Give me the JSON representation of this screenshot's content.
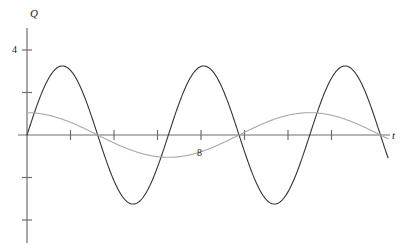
{
  "chart_data": {
    "type": "line",
    "title": "",
    "xlabel": "t",
    "ylabel": "Q",
    "xlim": [
      -0.2,
      17.2
    ],
    "ylim": [
      -4.8,
      5.2
    ],
    "grid": false,
    "legend": null,
    "axis_labels": {
      "y": "Q",
      "x": "t"
    },
    "y_ticks": [
      {
        "value": 4,
        "label": "4"
      },
      {
        "value": 2,
        "label": ""
      },
      {
        "value": -2,
        "label": ""
      },
      {
        "value": -4,
        "label": ""
      }
    ],
    "x_ticks": [
      {
        "value": 2,
        "label": ""
      },
      {
        "value": 4,
        "label": ""
      },
      {
        "value": 6,
        "label": ""
      },
      {
        "value": 8,
        "label": "8"
      },
      {
        "value": 10,
        "label": ""
      },
      {
        "value": 12,
        "label": ""
      },
      {
        "value": 14,
        "label": ""
      }
    ],
    "series": [
      {
        "name": "large-amplitude-wave",
        "color": "#333333",
        "form": "sine",
        "amplitude": 3.25,
        "period": 6.5,
        "phase": 0,
        "offset": 0,
        "linewidth": 1.1,
        "x": [
          0,
          0.8125,
          1.625,
          2.4375,
          3.25,
          4.0625,
          4.875,
          5.6875,
          6.5,
          7.3125,
          8.125,
          8.9375,
          9.75,
          10.5625,
          11.375,
          12.1875,
          13,
          13.8125,
          14.625,
          15.4375,
          16.25,
          17
        ],
        "y": [
          0,
          2.3,
          3.25,
          2.3,
          0,
          -2.3,
          -3.25,
          -2.3,
          0,
          2.3,
          3.25,
          2.3,
          0,
          -2.3,
          -3.25,
          -2.3,
          0,
          2.3,
          3.25,
          2.3,
          0,
          -2.3
        ]
      },
      {
        "name": "small-amplitude-wave",
        "color": "#a8a8a8",
        "form": "cosine",
        "amplitude": 1.05,
        "period": 13,
        "phase": 0,
        "offset": 0,
        "linewidth": 1.1,
        "x": [
          0,
          1.625,
          3.25,
          4.875,
          6.5,
          8.125,
          9.75,
          11.375,
          13,
          14.625,
          16.25,
          17
        ],
        "y": [
          1.05,
          0.74,
          0,
          -0.74,
          -1.05,
          -0.74,
          0,
          0.74,
          1.05,
          0.74,
          0,
          -0.37
        ]
      }
    ],
    "axis_color": "#6e6e6e",
    "background": "#ffffff"
  }
}
